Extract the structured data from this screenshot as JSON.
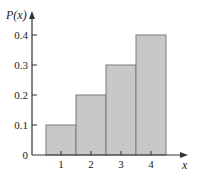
{
  "chart_data": {
    "type": "bar",
    "title": "",
    "xlabel": "x",
    "ylabel": "P(x)",
    "categories": [
      "1",
      "2",
      "3",
      "4"
    ],
    "values": [
      0.1,
      0.2,
      0.3,
      0.4
    ],
    "ylim": [
      0,
      0.45
    ],
    "yticks": [
      "0",
      "0.1",
      "0.2",
      "0.3",
      "0.4"
    ],
    "grid": false,
    "legend": null,
    "bar_color": "#c8c8c8",
    "bar_edge_color": "#7a7a7a",
    "axis_color": "#333333"
  }
}
